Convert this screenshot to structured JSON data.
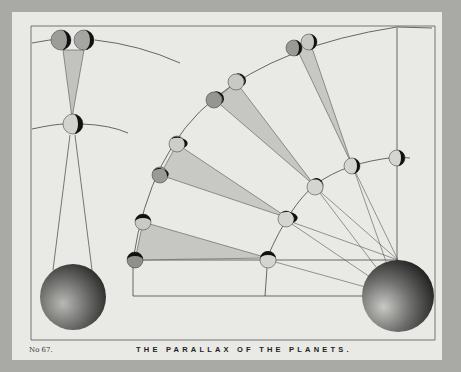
{
  "plate": {
    "number": "No 67.",
    "title": "THE PARALLAX OF THE PLANETS."
  },
  "colors": {
    "background": "#a9aaa6",
    "paper": "#e9eae6",
    "ink": "#444444",
    "cone_fill": "#c4c5c1",
    "planet_light": "#c9cac6",
    "planet_dark": "#111111"
  },
  "diagram": {
    "left_panel": {
      "description": "Two planets at a distant orbit, one near planet, lines to Earth",
      "earth": {
        "cx": 73,
        "cy": 297,
        "r": 33
      }
    },
    "right_panel": {
      "description": "Planets on two concentric orbits with parallax cones converging on Earth",
      "earth": {
        "cx": 398,
        "cy": 296,
        "r": 36
      }
    }
  }
}
